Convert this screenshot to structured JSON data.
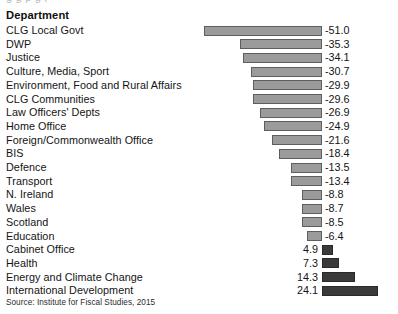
{
  "top_sliver_text": "g                                g          p                              g     ,",
  "column_header": "Department",
  "source_note": "Source: Institute for Fiscal Studies, 2015",
  "colors": {
    "negative_bar_fill": "#9b9b9b",
    "negative_bar_border": "#5e5e5e",
    "positive_bar_fill": "#3a3a3a",
    "positive_bar_border": "#2a2a2a",
    "background": "#ffffff",
    "text": "#141414"
  },
  "chart_data": {
    "type": "bar",
    "orientation": "horizontal",
    "title": "",
    "subtitle": "",
    "xlabel": "",
    "ylabel": "Department",
    "grid": false,
    "legend": "none",
    "zero_line_px": 322,
    "px_per_unit": 2.32,
    "xlim": [
      -51.0,
      24.1
    ],
    "categories": [
      "CLG Local Govt",
      "DWP",
      "Justice",
      "Culture, Media, Sport",
      "Environment, Food and Rural Affairs",
      "CLG Communities",
      "Law Officers' Depts",
      "Home Office",
      "Foreign/Commonwealth Office",
      "BIS",
      "Defence",
      "Transport",
      "N. Ireland",
      "Wales",
      "Scotland",
      "Education",
      "Cabinet Office",
      "Health",
      "Energy and Climate Change",
      "International Development"
    ],
    "values": [
      -51.0,
      -35.3,
      -34.1,
      -30.7,
      -29.9,
      -29.6,
      -26.9,
      -24.9,
      -21.6,
      -18.4,
      -13.5,
      -13.4,
      -8.8,
      -8.7,
      -8.5,
      -6.4,
      4.9,
      7.3,
      14.3,
      24.1
    ],
    "value_labels": [
      "-51.0",
      "-35.3",
      "-34.1",
      "-30.7",
      "-29.9",
      "-29.6",
      "-26.9",
      "-24.9",
      "-21.6",
      "-18.4",
      "-13.5",
      "-13.4",
      "-8.8",
      "-8.7",
      "-8.5",
      "-6.4",
      "4.9",
      "7.3",
      "14.3",
      "24.1"
    ]
  }
}
